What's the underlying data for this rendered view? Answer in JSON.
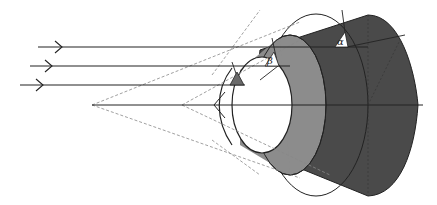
{
  "diagram": {
    "type": "optics-cone-reflection",
    "labels": {
      "alpha": "α",
      "beta": "β",
      "gamma": "γ"
    },
    "colors": {
      "outer_cone": "#4a4a4a",
      "middle_cone": "#8c8c8c",
      "inner_face": "#ffffff",
      "small_triangle": "#6a6a6a",
      "line": "#222222",
      "dashed": "#888888"
    },
    "rays": {
      "count": 3,
      "direction": "left-to-right"
    }
  }
}
